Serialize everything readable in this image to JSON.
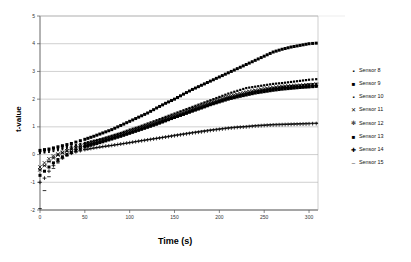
{
  "chart_data": {
    "type": "scatter",
    "title": "",
    "xlabel": "Time (s)",
    "ylabel": "t-value",
    "xlim": [
      0,
      310
    ],
    "ylim": [
      -2,
      5
    ],
    "xticks": [
      0,
      50,
      100,
      150,
      200,
      250,
      300
    ],
    "yticks": [
      -2,
      -1,
      0,
      1,
      2,
      3,
      4,
      5
    ],
    "grid": true,
    "legend_position": "right",
    "series": [
      {
        "name": "Sensor 8",
        "marker": "small-square",
        "x": [
          0,
          5,
          10,
          15,
          20,
          25,
          30,
          35,
          40,
          45,
          50,
          60,
          70,
          80,
          90,
          100,
          110,
          120,
          130,
          140,
          150,
          160,
          170,
          180,
          190,
          200,
          210,
          220,
          230,
          240,
          250,
          260,
          270,
          280,
          290,
          300,
          308
        ],
        "values": [
          0.1,
          0.12,
          0.15,
          0.18,
          0.2,
          0.24,
          0.28,
          0.3,
          0.34,
          0.38,
          0.42,
          0.5,
          0.58,
          0.68,
          0.78,
          0.9,
          1.0,
          1.12,
          1.24,
          1.36,
          1.48,
          1.6,
          1.72,
          1.84,
          1.96,
          2.08,
          2.2,
          2.3,
          2.4,
          2.45,
          2.5,
          2.55,
          2.58,
          2.62,
          2.66,
          2.7,
          2.72
        ]
      },
      {
        "name": "Sensor 9",
        "marker": "filled-square",
        "x": [
          0,
          5,
          10,
          15,
          20,
          25,
          30,
          35,
          40,
          45,
          50,
          60,
          70,
          80,
          90,
          100,
          110,
          120,
          130,
          140,
          150,
          160,
          170,
          180,
          190,
          200,
          210,
          220,
          230,
          240,
          250,
          260,
          270,
          280,
          290,
          300,
          308
        ],
        "values": [
          0.15,
          0.18,
          0.2,
          0.24,
          0.28,
          0.32,
          0.36,
          0.4,
          0.45,
          0.5,
          0.55,
          0.66,
          0.78,
          0.9,
          1.05,
          1.2,
          1.35,
          1.5,
          1.68,
          1.85,
          2.0,
          2.18,
          2.35,
          2.5,
          2.65,
          2.8,
          2.95,
          3.1,
          3.25,
          3.4,
          3.55,
          3.7,
          3.8,
          3.88,
          3.94,
          4.0,
          4.02
        ]
      },
      {
        "name": "Sensor 10",
        "marker": "small-dot",
        "x": [
          0,
          5,
          10,
          15,
          20,
          25,
          30,
          35,
          40,
          45,
          50,
          60,
          70,
          80,
          90,
          100,
          110,
          120,
          130,
          140,
          150,
          160,
          170,
          180,
          190,
          200,
          210,
          220,
          230,
          240,
          250,
          260,
          270,
          280,
          290,
          300,
          308
        ],
        "values": [
          0.05,
          0.07,
          0.09,
          0.12,
          0.15,
          0.18,
          0.21,
          0.24,
          0.27,
          0.3,
          0.34,
          0.41,
          0.49,
          0.57,
          0.66,
          0.76,
          0.86,
          0.97,
          1.08,
          1.2,
          1.32,
          1.44,
          1.56,
          1.68,
          1.8,
          1.92,
          2.02,
          2.12,
          2.2,
          2.28,
          2.34,
          2.4,
          2.44,
          2.48,
          2.5,
          2.54,
          2.56
        ]
      },
      {
        "name": "Sensor 11",
        "marker": "cross-x",
        "x": [
          0,
          5,
          10,
          15,
          20,
          25,
          30,
          35,
          40,
          45,
          50,
          60,
          70,
          80,
          90,
          100,
          110,
          120,
          130,
          140,
          150,
          160,
          170,
          180,
          190,
          200,
          210,
          220,
          230,
          240,
          250,
          260,
          270,
          280,
          290,
          300,
          308
        ],
        "values": [
          -0.45,
          -0.3,
          -0.15,
          -0.05,
          0.02,
          0.08,
          0.14,
          0.2,
          0.25,
          0.3,
          0.35,
          0.44,
          0.53,
          0.63,
          0.73,
          0.84,
          0.95,
          1.06,
          1.18,
          1.3,
          1.42,
          1.54,
          1.66,
          1.78,
          1.9,
          2.0,
          2.1,
          2.18,
          2.26,
          2.32,
          2.38,
          2.42,
          2.46,
          2.48,
          2.5,
          2.52,
          2.54
        ]
      },
      {
        "name": "Sensor 12",
        "marker": "star-x",
        "x": [
          0,
          5,
          10,
          15,
          20,
          25,
          30,
          35,
          40,
          45,
          50,
          60,
          70,
          80,
          90,
          100,
          110,
          120,
          130,
          140,
          150,
          160,
          170,
          180,
          190,
          200,
          210,
          220,
          230,
          240,
          250,
          260,
          270,
          280,
          290,
          300,
          308
        ],
        "values": [
          -0.55,
          -0.4,
          -0.25,
          -0.12,
          -0.02,
          0.06,
          0.12,
          0.18,
          0.24,
          0.29,
          0.34,
          0.43,
          0.52,
          0.62,
          0.72,
          0.82,
          0.93,
          1.04,
          1.15,
          1.27,
          1.39,
          1.5,
          1.62,
          1.73,
          1.85,
          1.95,
          2.05,
          2.13,
          2.2,
          2.27,
          2.32,
          2.37,
          2.41,
          2.44,
          2.46,
          2.48,
          2.5
        ]
      },
      {
        "name": "Sensor 13",
        "marker": "filled-square",
        "x": [
          0,
          5,
          10,
          15,
          20,
          25,
          30,
          35,
          40,
          45,
          50,
          60,
          70,
          80,
          90,
          100,
          110,
          120,
          130,
          140,
          150,
          160,
          170,
          180,
          190,
          200,
          210,
          220,
          230,
          240,
          250,
          260,
          270,
          280,
          290,
          300,
          308
        ],
        "values": [
          -0.75,
          -0.6,
          -0.45,
          -0.3,
          -0.18,
          -0.08,
          0.0,
          0.08,
          0.15,
          0.21,
          0.27,
          0.37,
          0.46,
          0.56,
          0.66,
          0.77,
          0.88,
          0.99,
          1.1,
          1.22,
          1.34,
          1.45,
          1.57,
          1.68,
          1.8,
          1.9,
          2.0,
          2.08,
          2.15,
          2.22,
          2.27,
          2.32,
          2.36,
          2.39,
          2.42,
          2.44,
          2.46
        ]
      },
      {
        "name": "Sensor 14",
        "marker": "plus",
        "x": [
          0,
          5,
          10,
          15,
          20,
          25,
          30,
          35,
          40,
          45,
          50,
          60,
          70,
          80,
          90,
          100,
          110,
          120,
          130,
          140,
          150,
          160,
          170,
          180,
          190,
          200,
          210,
          220,
          230,
          240,
          250,
          260,
          270,
          280,
          290,
          300,
          308
        ],
        "values": [
          -1.0,
          -0.85,
          -0.6,
          -0.4,
          -0.25,
          -0.12,
          -0.02,
          0.05,
          0.1,
          0.14,
          0.18,
          0.24,
          0.29,
          0.33,
          0.38,
          0.43,
          0.48,
          0.53,
          0.58,
          0.63,
          0.68,
          0.73,
          0.78,
          0.82,
          0.87,
          0.91,
          0.95,
          0.98,
          1.0,
          1.03,
          1.05,
          1.07,
          1.08,
          1.09,
          1.1,
          1.11,
          1.12
        ]
      },
      {
        "name": "Sensor 15",
        "marker": "dash",
        "x": [
          0,
          5,
          10,
          15,
          20,
          25,
          30,
          35,
          40,
          45,
          50,
          60,
          70,
          80,
          90,
          100,
          110,
          120,
          130,
          140,
          150,
          160,
          170,
          180,
          190,
          200,
          210,
          220,
          230,
          240,
          250,
          260,
          270,
          280,
          290,
          300,
          308
        ],
        "values": [
          -1.95,
          -1.3,
          -0.8,
          -0.5,
          -0.3,
          -0.15,
          -0.05,
          0.03,
          0.09,
          0.13,
          0.17,
          0.23,
          0.28,
          0.33,
          0.38,
          0.43,
          0.49,
          0.54,
          0.59,
          0.64,
          0.7,
          0.75,
          0.8,
          0.85,
          0.89,
          0.93,
          0.97,
          1.0,
          1.02,
          1.05,
          1.07,
          1.09,
          1.1,
          1.11,
          1.12,
          1.13,
          1.14
        ]
      }
    ]
  },
  "legend": {
    "items": [
      {
        "label": "Sensor 8",
        "glyph": "▪"
      },
      {
        "label": "Sensor 9",
        "glyph": "■"
      },
      {
        "label": "Sensor 10",
        "glyph": "▪"
      },
      {
        "label": "Sensor 11",
        "glyph": "✕"
      },
      {
        "label": "Sensor 12",
        "glyph": "✻"
      },
      {
        "label": "Sensor 13",
        "glyph": "■"
      },
      {
        "label": "Sensor 14",
        "glyph": "✚"
      },
      {
        "label": "Sensor 15",
        "glyph": "‒"
      }
    ]
  },
  "axes": {
    "y_title": "t-value",
    "x_title": "Time (s)",
    "x_tick_labels": [
      "0",
      "50",
      "100",
      "150",
      "200",
      "250",
      "300"
    ],
    "y_tick_labels": [
      "5",
      "4",
      "3",
      "2",
      "1",
      "0",
      "-1",
      "-2"
    ]
  },
  "colors": {
    "marker": "#000000",
    "grid": "#b0b0b0",
    "axis": "#555555",
    "background": "#ffffff",
    "legend_border": "#c8c8c8"
  }
}
